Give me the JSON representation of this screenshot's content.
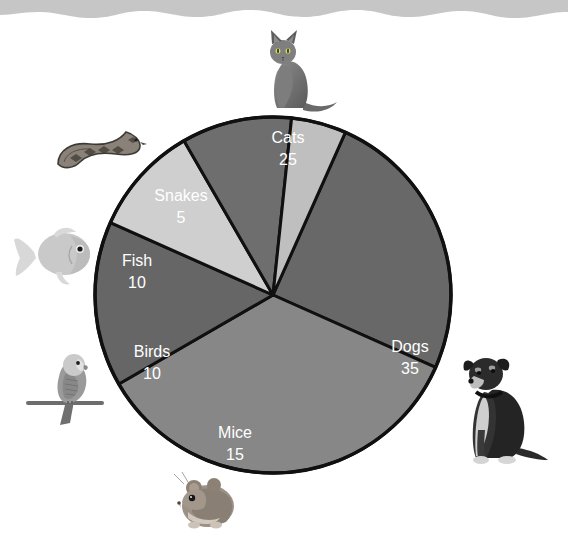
{
  "page": {
    "background_color": "#ffffff",
    "top_band_color": "#c6c6c6",
    "label_text_color": "#ffffff",
    "slice_outline_color": "#101010"
  },
  "chart_data": {
    "type": "pie",
    "title": "",
    "subtitle": "",
    "xlabel": "",
    "ylabel": "",
    "legend_position": "none",
    "grid": false,
    "total": 100,
    "categories": [
      "Cats",
      "Dogs",
      "Mice",
      "Birds",
      "Fish",
      "Snakes"
    ],
    "values": [
      25,
      35,
      15,
      10,
      10,
      5
    ],
    "slices": [
      {
        "label": "Cats",
        "value": 25,
        "value_text": "25",
        "percent": 25,
        "color": "#686868",
        "start_angle_deg": -66,
        "sweep_deg": 90,
        "label_x": 288,
        "label_y": 139,
        "value_x": 288,
        "value_y": 161
      },
      {
        "label": "Dogs",
        "value": 35,
        "value_text": "35",
        "percent": 35,
        "color": "#878787",
        "start_angle_deg": 24,
        "sweep_deg": 126,
        "label_x": 410,
        "label_y": 348,
        "value_x": 410,
        "value_y": 370
      },
      {
        "label": "Mice",
        "value": 15,
        "value_text": "15",
        "percent": 15,
        "color": "#666666",
        "start_angle_deg": 150,
        "sweep_deg": 54,
        "label_x": 235,
        "label_y": 434,
        "value_x": 235,
        "value_y": 456
      },
      {
        "label": "Birds",
        "value": 10,
        "value_text": "10",
        "percent": 10,
        "color": "#cfcfcf",
        "start_angle_deg": 204,
        "sweep_deg": 36,
        "label_x": 152,
        "label_y": 353,
        "value_x": 152,
        "value_y": 375
      },
      {
        "label": "Fish",
        "value": 10,
        "value_text": "10",
        "percent": 10,
        "color": "#6e6e6e",
        "start_angle_deg": 240,
        "sweep_deg": 36,
        "label_x": 137,
        "label_y": 262,
        "value_x": 137,
        "value_y": 284
      },
      {
        "label": "Snakes",
        "value": 5,
        "value_text": "5",
        "percent": 5,
        "color": "#bfbfbf",
        "start_angle_deg": 276,
        "sweep_deg": 18,
        "label_x": 181,
        "label_y": 197,
        "value_x": 181,
        "value_y": 219
      }
    ],
    "geometry": {
      "center_x": 273,
      "center_y": 295,
      "radius": 178
    }
  },
  "illustrations": [
    {
      "name": "cat-photo",
      "animal": "cat",
      "x": 245,
      "y": 22,
      "w": 95,
      "h": 95
    },
    {
      "name": "snake-photo",
      "animal": "snake",
      "x": 50,
      "y": 120,
      "w": 100,
      "h": 60
    },
    {
      "name": "fish-photo",
      "animal": "fish",
      "x": 12,
      "y": 218,
      "w": 92,
      "h": 72
    },
    {
      "name": "bird-photo",
      "animal": "bird",
      "x": 22,
      "y": 343,
      "w": 92,
      "h": 85
    },
    {
      "name": "mouse-photo",
      "animal": "mouse",
      "x": 158,
      "y": 468,
      "w": 92,
      "h": 72
    },
    {
      "name": "dog-photo",
      "animal": "dog",
      "x": 452,
      "y": 344,
      "w": 100,
      "h": 130
    }
  ]
}
